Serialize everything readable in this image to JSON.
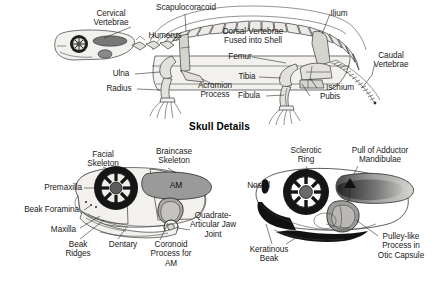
{
  "figure": {
    "title": "Skull Details",
    "background_color": "#ffffff",
    "ink_color": "#1a1a1a",
    "panels": [
      {
        "id": "skeleton",
        "name": "turtle-skeleton-lateral"
      },
      {
        "id": "skull-left",
        "name": "skull-left-lateral-muscles"
      },
      {
        "id": "skull-right",
        "name": "skull-right-lateral-pulley"
      }
    ]
  },
  "skeleton": {
    "labels": {
      "cervical_vertebrae": "Cervical\nVertebrae",
      "scapulocoracoid": "Scapulocoracoid",
      "humerus": "Humerus",
      "dorsal_vertebrae": "Dorsal Vertebrae\nFused into Shell",
      "ilium": "Ilium",
      "caudal_vertebrae": "Caudal\nVertebrae",
      "femur": "Femur",
      "tibia": "Tibia",
      "fibula": "Fibula",
      "ischium": "Ischium",
      "pubis": "Pubis",
      "ulna": "Ulna",
      "radius": "Radius",
      "acromion_process": "Acromion\nProcess"
    }
  },
  "skull_left": {
    "labels": {
      "facial_skeleton": "Facial\nSkeleton",
      "braincase_skeleton": "Braincase\nSkeleton",
      "am": "AM",
      "premaxilla": "Premaxilla",
      "beak_foramina": "Beak Foramina",
      "maxilla": "Maxilla",
      "beak_ridges": "Beak\nRidges",
      "dentary": "Dentary",
      "coronoid_process": "Coronoid\nProcess for\nAM",
      "quadrate_articular": "Quadrate-\nArticular Jaw\nJoint"
    }
  },
  "skull_right": {
    "labels": {
      "sclerotic_ring": "Sclerotic\nRing",
      "pull_of_adductor": "Pull of Adductor\nMandibulae",
      "nostril": "Nostril",
      "keratinous_beak": "Keratinous\nBeak",
      "pulley_like_process": "Pulley-like\nProcess in\nOtic Capsule"
    }
  }
}
